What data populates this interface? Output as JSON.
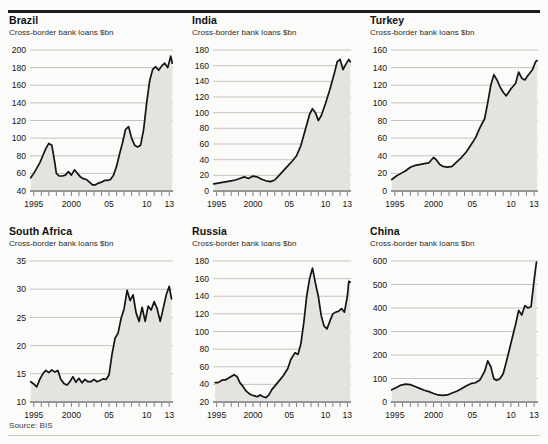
{
  "source_note": "Source: BIS",
  "common": {
    "subtitle": "Cross-border bank loans $bn",
    "x_ticks": [
      "1995",
      "2000",
      "05",
      "10",
      "13"
    ],
    "x_tick_years": [
      1995,
      2000,
      2005,
      2010,
      2013
    ],
    "line_color": "#141414",
    "fill_color": "#e3e3e0",
    "grid_color": "#9d9d98",
    "background": "#fbfbf9"
  },
  "panels": [
    {
      "id": "brazil",
      "title": "Brazil",
      "subtitle": "Cross-border bank loans $bn"
    },
    {
      "id": "india",
      "title": "India",
      "subtitle": "Cross-border bank loans $bn"
    },
    {
      "id": "turkey",
      "title": "Turkey",
      "subtitle": "Cross-border bank loans $bn"
    },
    {
      "id": "south-africa",
      "title": "South Africa",
      "subtitle": "Cross-border bank loans $bn"
    },
    {
      "id": "russia",
      "title": "Russia",
      "subtitle": "Cross-border bank loans $bn"
    },
    {
      "id": "china",
      "title": "China",
      "subtitle": "Cross-border bank loans $bn"
    }
  ],
  "chart_data": [
    {
      "id": "brazil",
      "type": "area",
      "title": "Brazil",
      "subtitle": "Cross-border bank loans $bn",
      "xlabel": "",
      "ylabel": "$bn",
      "ylim": [
        40,
        200
      ],
      "yticks": [
        40,
        60,
        80,
        100,
        120,
        140,
        160,
        180,
        200
      ],
      "xlim": [
        1994.5,
        2013.5
      ],
      "xticks": [
        1995,
        2000,
        2005,
        2010,
        2013
      ],
      "xticklabels": [
        "1995",
        "2000",
        "05",
        "10",
        "13"
      ],
      "grid": "horizontal",
      "x": [
        1994.6,
        1995.0,
        1995.4,
        1995.8,
        1996.2,
        1996.6,
        1997.0,
        1997.4,
        1997.8,
        1998.0,
        1998.4,
        1998.8,
        1999.2,
        1999.6,
        2000.0,
        2000.4,
        2000.8,
        2001.2,
        2001.6,
        2002.0,
        2002.4,
        2002.8,
        2003.2,
        2003.6,
        2004.0,
        2004.4,
        2004.8,
        2005.2,
        2005.6,
        2006.0,
        2006.4,
        2006.8,
        2007.2,
        2007.6,
        2008.0,
        2008.4,
        2008.8,
        2009.2,
        2009.6,
        2010.0,
        2010.4,
        2010.8,
        2011.2,
        2011.6,
        2012.0,
        2012.4,
        2012.8,
        2013.2,
        2013.4
      ],
      "y": [
        55,
        60,
        66,
        72,
        80,
        88,
        94,
        92,
        72,
        60,
        57,
        57,
        58,
        62,
        58,
        64,
        60,
        56,
        54,
        53,
        50,
        47,
        47,
        49,
        50,
        52,
        52,
        53,
        58,
        68,
        82,
        95,
        110,
        113,
        100,
        92,
        90,
        92,
        110,
        140,
        165,
        178,
        181,
        177,
        182,
        185,
        180,
        193,
        185
      ]
    },
    {
      "id": "india",
      "type": "area",
      "title": "India",
      "subtitle": "Cross-border bank loans $bn",
      "xlabel": "",
      "ylabel": "$bn",
      "ylim": [
        0,
        180
      ],
      "yticks": [
        0,
        20,
        40,
        60,
        80,
        100,
        120,
        140,
        160,
        180
      ],
      "xlim": [
        1994.5,
        2013.5
      ],
      "xticks": [
        1995,
        2000,
        2005,
        2010,
        2013
      ],
      "xticklabels": [
        "1995",
        "2000",
        "05",
        "10",
        "13"
      ],
      "grid": "horizontal",
      "x": [
        1994.6,
        1995.2,
        1995.8,
        1996.4,
        1997.0,
        1997.6,
        1998.2,
        1998.8,
        1999.4,
        2000.0,
        2000.6,
        2001.2,
        2001.8,
        2002.4,
        2003.0,
        2003.6,
        2004.2,
        2004.8,
        2005.4,
        2006.0,
        2006.6,
        2007.2,
        2007.8,
        2008.2,
        2008.6,
        2009.0,
        2009.4,
        2010.0,
        2010.6,
        2011.2,
        2011.6,
        2012.0,
        2012.4,
        2012.8,
        2013.2,
        2013.4
      ],
      "y": [
        9,
        10,
        11,
        12,
        13,
        14,
        16,
        18,
        16,
        19,
        18,
        15,
        13,
        12,
        14,
        20,
        26,
        32,
        38,
        45,
        58,
        78,
        98,
        105,
        100,
        90,
        96,
        112,
        130,
        150,
        165,
        168,
        155,
        162,
        168,
        165
      ]
    },
    {
      "id": "turkey",
      "type": "area",
      "title": "Turkey",
      "subtitle": "Cross-border bank loans $bn",
      "xlabel": "",
      "ylabel": "$bn",
      "ylim": [
        0,
        160
      ],
      "yticks": [
        0,
        20,
        40,
        60,
        80,
        100,
        120,
        140,
        160
      ],
      "xlim": [
        1994.5,
        2013.5
      ],
      "xticks": [
        1995,
        2000,
        2005,
        2010,
        2013
      ],
      "xticklabels": [
        "1995",
        "2000",
        "05",
        "10",
        "13"
      ],
      "grid": "horizontal",
      "x": [
        1994.6,
        1995.2,
        1995.8,
        1996.4,
        1997.0,
        1997.6,
        1998.2,
        1998.8,
        1999.4,
        2000.0,
        2000.4,
        2000.8,
        2001.2,
        2001.8,
        2002.4,
        2003.0,
        2003.6,
        2004.2,
        2004.8,
        2005.4,
        2006.0,
        2006.6,
        2007.0,
        2007.4,
        2007.8,
        2008.2,
        2008.6,
        2009.0,
        2009.4,
        2010.0,
        2010.6,
        2011.0,
        2011.4,
        2011.8,
        2012.2,
        2012.8,
        2013.2,
        2013.4
      ],
      "y": [
        13,
        17,
        20,
        23,
        27,
        29,
        30,
        31,
        32,
        38,
        35,
        30,
        28,
        27,
        28,
        33,
        38,
        44,
        52,
        60,
        72,
        82,
        100,
        120,
        132,
        126,
        118,
        112,
        108,
        116,
        122,
        135,
        128,
        126,
        131,
        138,
        147,
        148
      ]
    },
    {
      "id": "south-africa",
      "type": "area",
      "title": "South Africa",
      "subtitle": "Cross-border bank loans $bn",
      "xlabel": "",
      "ylabel": "$bn",
      "ylim": [
        10,
        35
      ],
      "yticks": [
        10,
        15,
        20,
        25,
        30,
        35
      ],
      "xlim": [
        1994.5,
        2013.5
      ],
      "xticks": [
        1995,
        2000,
        2005,
        2010,
        2013
      ],
      "xticklabels": [
        "1995",
        "2000",
        "05",
        "10",
        "13"
      ],
      "grid": "horizontal",
      "x": [
        1994.6,
        1995.0,
        1995.4,
        1995.8,
        1996.2,
        1996.6,
        1997.0,
        1997.4,
        1997.8,
        1998.2,
        1998.6,
        1999.0,
        1999.4,
        1999.8,
        2000.2,
        2000.6,
        2001.0,
        2001.4,
        2001.8,
        2002.2,
        2002.6,
        2003.0,
        2003.4,
        2003.8,
        2004.2,
        2004.6,
        2005.0,
        2005.4,
        2005.8,
        2006.2,
        2006.6,
        2007.0,
        2007.4,
        2007.8,
        2008.2,
        2008.6,
        2009.0,
        2009.4,
        2009.8,
        2010.2,
        2010.6,
        2011.0,
        2011.4,
        2011.8,
        2012.2,
        2012.6,
        2013.0,
        2013.3
      ],
      "y": [
        13.6,
        13.2,
        12.7,
        14.0,
        15.0,
        15.6,
        15.2,
        15.7,
        15.3,
        15.6,
        14.0,
        13.3,
        13.0,
        13.6,
        14.5,
        13.5,
        14.2,
        13.4,
        14.0,
        13.6,
        13.6,
        14.0,
        13.6,
        13.8,
        14.1,
        14.0,
        14.8,
        18.5,
        21.3,
        22.2,
        24.8,
        26.5,
        29.8,
        28.0,
        29.0,
        25.8,
        24.3,
        26.8,
        24.3,
        27.0,
        26.3,
        27.8,
        26.5,
        24.3,
        26.6,
        29.0,
        30.5,
        28.3
      ]
    },
    {
      "id": "russia",
      "type": "area",
      "title": "Russia",
      "subtitle": "Cross-border bank loans $bn",
      "xlabel": "",
      "ylabel": "$bn",
      "ylim": [
        20,
        180
      ],
      "yticks": [
        20,
        40,
        60,
        80,
        100,
        120,
        140,
        160,
        180
      ],
      "xlim": [
        1994.5,
        2013.5
      ],
      "xticks": [
        1995,
        2000,
        2005,
        2010,
        2013
      ],
      "xticklabels": [
        "1995",
        "2000",
        "05",
        "10",
        "13"
      ],
      "grid": "horizontal",
      "x": [
        1994.8,
        1995.2,
        1995.8,
        1996.2,
        1996.6,
        1997.0,
        1997.4,
        1997.8,
        1998.2,
        1998.6,
        1999.0,
        1999.4,
        1999.8,
        2000.2,
        2000.6,
        2001.0,
        2001.4,
        2001.8,
        2002.2,
        2002.6,
        2003.0,
        2003.4,
        2003.8,
        2004.2,
        2004.8,
        2005.2,
        2005.8,
        2006.2,
        2006.6,
        2007.0,
        2007.4,
        2007.8,
        2008.2,
        2008.6,
        2009.0,
        2009.4,
        2009.8,
        2010.2,
        2010.6,
        2011.0,
        2011.4,
        2011.8,
        2012.2,
        2012.6,
        2013.0,
        2013.2,
        2013.4
      ],
      "y": [
        42,
        42,
        45,
        45,
        47,
        49,
        51,
        49,
        42,
        38,
        33,
        30,
        28,
        27,
        26,
        28,
        26,
        25,
        28,
        34,
        38,
        42,
        46,
        50,
        58,
        68,
        76,
        74,
        86,
        110,
        140,
        160,
        172,
        155,
        140,
        118,
        106,
        103,
        112,
        120,
        122,
        123,
        126,
        122,
        140,
        157,
        156
      ]
    },
    {
      "id": "china",
      "type": "area",
      "title": "China",
      "subtitle": "Cross-border bank loans $bn",
      "xlabel": "",
      "ylabel": "$bn",
      "ylim": [
        0,
        600
      ],
      "yticks": [
        0,
        100,
        200,
        300,
        400,
        500,
        600
      ],
      "xlim": [
        1994.5,
        2013.5
      ],
      "xticks": [
        1995,
        2000,
        2005,
        2010,
        2013
      ],
      "xticklabels": [
        "1995",
        "2000",
        "05",
        "10",
        "13"
      ],
      "grid": "horizontal",
      "x": [
        1994.6,
        1995.2,
        1995.8,
        1996.4,
        1997.0,
        1997.6,
        1998.2,
        1998.8,
        1999.4,
        2000.0,
        2000.6,
        2001.2,
        2001.8,
        2002.4,
        2003.0,
        2003.6,
        2004.2,
        2004.8,
        2005.4,
        2006.0,
        2006.6,
        2007.0,
        2007.4,
        2007.8,
        2008.2,
        2008.6,
        2009.0,
        2009.4,
        2010.0,
        2010.6,
        2011.0,
        2011.4,
        2011.8,
        2012.2,
        2012.6,
        2013.0,
        2013.3
      ],
      "y": [
        52,
        62,
        72,
        76,
        74,
        66,
        58,
        50,
        44,
        36,
        30,
        28,
        30,
        38,
        46,
        56,
        68,
        78,
        82,
        94,
        130,
        175,
        150,
        98,
        92,
        100,
        120,
        170,
        250,
        330,
        390,
        370,
        410,
        400,
        405,
        520,
        595
      ]
    }
  ]
}
